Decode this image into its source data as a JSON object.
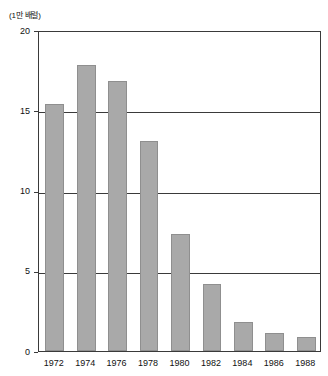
{
  "chart_data": {
    "type": "bar",
    "title": "",
    "subtitle": "",
    "xlabel": "",
    "ylabel": "(1만 배럴)",
    "unit_label": "(1만 배럴)",
    "categories": [
      "1972",
      "1974",
      "1976",
      "1978",
      "1980",
      "1982",
      "1984",
      "1986",
      "1988"
    ],
    "values": [
      15.4,
      17.8,
      16.8,
      13.1,
      7.3,
      4.2,
      1.8,
      1.1,
      0.85
    ],
    "ylim": [
      0,
      20
    ],
    "yticks": [
      0,
      5,
      10,
      15,
      20
    ],
    "ytick_labels": [
      "0",
      "5",
      "10",
      "15",
      "20"
    ],
    "gridlines": [
      5,
      10,
      15
    ],
    "grid": true,
    "legend": null,
    "legend_position": "none",
    "series": [
      {
        "name": "",
        "values": [
          15.4,
          17.8,
          16.8,
          13.1,
          7.3,
          4.2,
          1.8,
          1.1,
          0.85
        ]
      }
    ],
    "colors": {
      "bar_fill": "#a9a9a9",
      "bar_border": "#8f8f8f",
      "axis": "#3a3a3a",
      "grid": "#3a3a3a",
      "text": "#111111",
      "background": "#ffffff"
    }
  }
}
